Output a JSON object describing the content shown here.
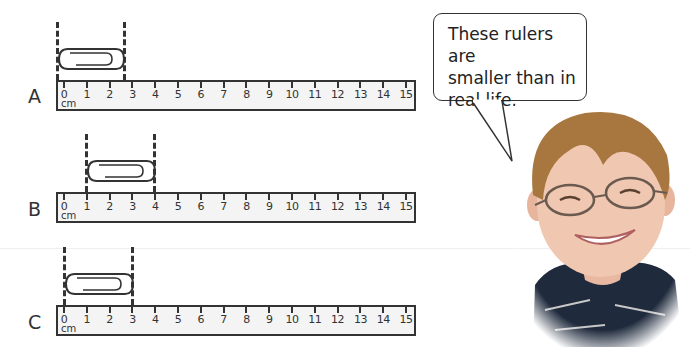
{
  "rulers": [
    {
      "label": "A",
      "unit": "cm",
      "ticks": [
        "0",
        "1",
        "2",
        "3",
        "4",
        "5",
        "6",
        "7",
        "8",
        "9",
        "10",
        "11",
        "12",
        "13",
        "14",
        "15"
      ],
      "clip_start_cm": 0,
      "clip_end_cm": 2.7
    },
    {
      "label": "B",
      "unit": "cm",
      "ticks": [
        "0",
        "1",
        "2",
        "3",
        "4",
        "5",
        "6",
        "7",
        "8",
        "9",
        "10",
        "11",
        "12",
        "13",
        "14",
        "15"
      ],
      "clip_start_cm": 1,
      "clip_end_cm": 4
    },
    {
      "label": "C",
      "unit": "cm",
      "ticks": [
        "0",
        "1",
        "2",
        "3",
        "4",
        "5",
        "6",
        "7",
        "8",
        "9",
        "10",
        "11",
        "12",
        "13",
        "14",
        "15"
      ],
      "clip_start_cm": 0,
      "clip_end_cm": 3
    }
  ],
  "speech_bubble": {
    "line1": "These rulers are",
    "line2": "smaller than in",
    "line3": "real life."
  },
  "illustration": {
    "subject": "smiling-boy-with-glasses"
  },
  "colors": {
    "stroke": "#333333",
    "ruler_fill": "#f4f4f4",
    "background": "#ffffff"
  }
}
